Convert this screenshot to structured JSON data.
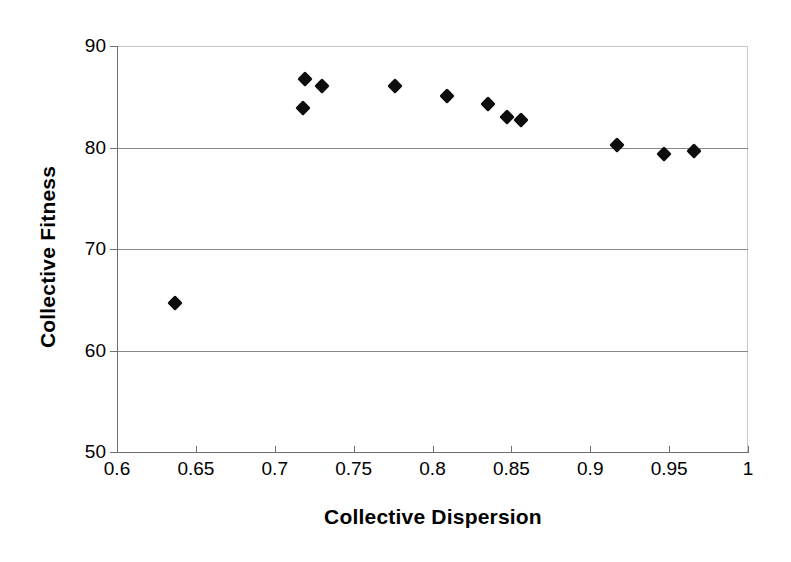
{
  "chart_data": {
    "type": "scatter",
    "title": "",
    "xlabel": "Collective Dispersion",
    "ylabel": "Collective Fitness",
    "xlim": [
      0.6,
      1
    ],
    "ylim": [
      50,
      90
    ],
    "grid": true,
    "legend": null,
    "x_ticks": [
      "0.6",
      "0.65",
      "0.7",
      "0.75",
      "0.8",
      "0.85",
      "0.9",
      "0.95",
      "1"
    ],
    "x_tick_values": [
      0.6,
      0.65,
      0.7,
      0.75,
      0.8,
      0.85,
      0.9,
      0.95,
      1
    ],
    "y_ticks": [
      "90",
      "80",
      "70",
      "60",
      "50"
    ],
    "y_tick_values": [
      90,
      80,
      70,
      60,
      50
    ],
    "marker": "diamond",
    "marker_color": "#0d0d0d",
    "series": [
      {
        "name": "Collective Fitness vs Dispersion",
        "points": [
          {
            "x": 0.637,
            "y": 64.7
          },
          {
            "x": 0.718,
            "y": 83.9
          },
          {
            "x": 0.719,
            "y": 86.7
          },
          {
            "x": 0.73,
            "y": 86.1
          },
          {
            "x": 0.776,
            "y": 86.1
          },
          {
            "x": 0.809,
            "y": 85.1
          },
          {
            "x": 0.835,
            "y": 84.3
          },
          {
            "x": 0.847,
            "y": 83.0
          },
          {
            "x": 0.856,
            "y": 82.7
          },
          {
            "x": 0.917,
            "y": 80.2
          },
          {
            "x": 0.947,
            "y": 79.4
          },
          {
            "x": 0.966,
            "y": 79.7
          }
        ]
      }
    ]
  }
}
